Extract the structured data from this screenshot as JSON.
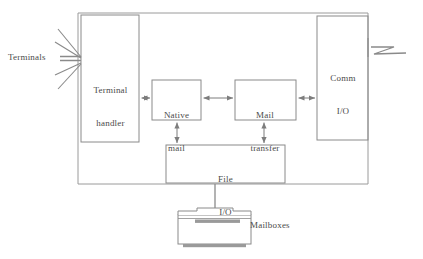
{
  "diagram": {
    "stroke_color": "#8a8a8a",
    "dark_fill_color": "#9a9a9a",
    "text_color": "#4a4a4a",
    "background_color": "#ffffff",
    "blocks": [
      {
        "id": "terminal-handler",
        "label": "Terminal\nhandler",
        "line1": "Terminal",
        "line2": "handler",
        "x": 81,
        "y": 15,
        "width": 58,
        "height": 127
      },
      {
        "id": "native-mail",
        "label": "Native\nmail",
        "line1": "Native",
        "line2": "mail",
        "x": 152,
        "y": 80,
        "width": 49,
        "height": 40
      },
      {
        "id": "mail-transfer",
        "label": "Mail\ntransfer",
        "line1": "Mail",
        "line2": "transfer",
        "x": 235,
        "y": 80,
        "width": 61,
        "height": 40
      },
      {
        "id": "comm-io",
        "label": "Comm\nI/O",
        "line1": "Comm",
        "line2": "I/O",
        "x": 317,
        "y": 16,
        "width": 51,
        "height": 124
      },
      {
        "id": "file-io",
        "label": "File\nI/O",
        "line1": "File",
        "line2": "I/O",
        "x": 166,
        "y": 145,
        "width": 119,
        "height": 38
      }
    ],
    "outer_box": {
      "id": "system-boundary",
      "x": 78,
      "y": 13,
      "width": 290,
      "height": 171
    },
    "external_labels": [
      {
        "id": "terminals",
        "text": "Terminals"
      },
      {
        "id": "mailboxes",
        "text": "Mailboxes"
      }
    ],
    "connections": [
      {
        "id": "terminal-handler-to-native-mail",
        "from": "terminal-handler",
        "to": "native-mail",
        "type": "bidirectional"
      },
      {
        "id": "native-mail-to-mail-transfer",
        "from": "native-mail",
        "to": "mail-transfer",
        "type": "bidirectional"
      },
      {
        "id": "mail-transfer-to-comm-io",
        "from": "mail-transfer",
        "to": "comm-io",
        "type": "bidirectional"
      },
      {
        "id": "native-mail-to-file-io",
        "from": "native-mail",
        "to": "file-io",
        "type": "bidirectional"
      },
      {
        "id": "mail-transfer-to-file-io",
        "from": "mail-transfer",
        "to": "file-io",
        "type": "bidirectional"
      },
      {
        "id": "file-io-to-mailboxes",
        "from": "file-io",
        "to": "mailboxes-storage",
        "type": "line"
      }
    ],
    "symbols": [
      {
        "id": "terminal-fan",
        "name": "terminal-fan-lines",
        "description": "fan of lines from Terminals label to Terminal handler"
      },
      {
        "id": "network-zigzag",
        "name": "network-link-zigzag",
        "description": "zigzag line extending right from Comm I/O"
      },
      {
        "id": "mailboxes-storage",
        "name": "disk-storage-icon",
        "description": "disk drive storage symbol below File I/O"
      }
    ]
  }
}
